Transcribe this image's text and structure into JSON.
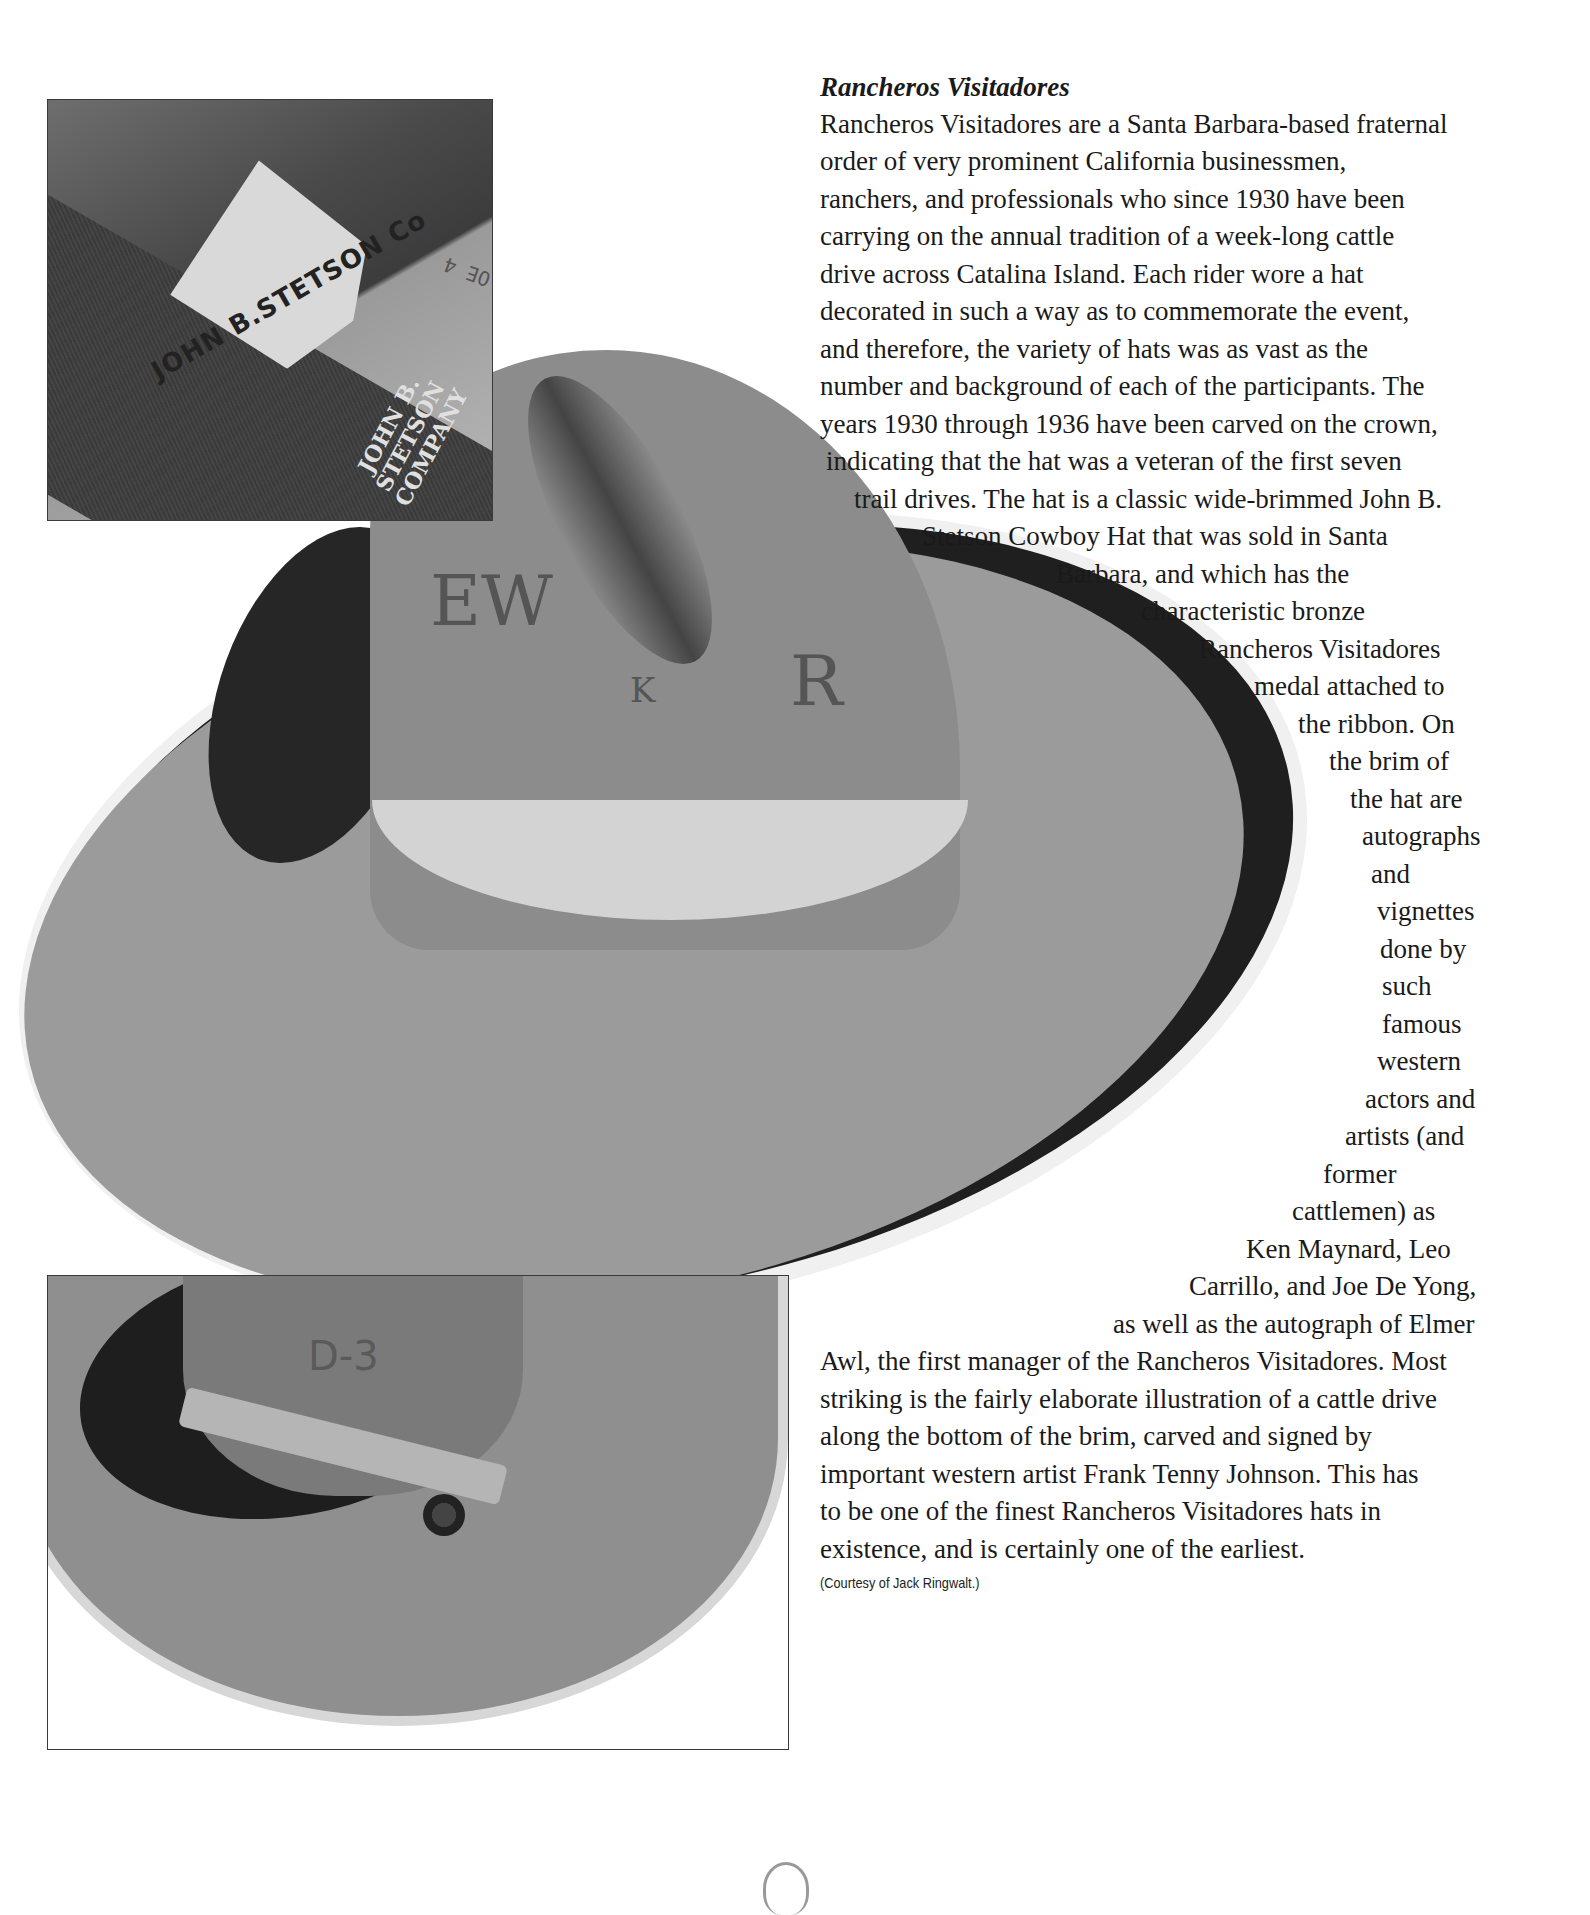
{
  "article": {
    "title": "Rancheros Visitadores",
    "lines": [
      {
        "text": "Rancheros Visitadores are a Santa Barbara-based fraternal",
        "x": 820,
        "y": 109
      },
      {
        "text": "order of very prominent California businessmen,",
        "x": 820,
        "y": 146
      },
      {
        "text": "ranchers, and professionals who since 1930 have been",
        "x": 820,
        "y": 184
      },
      {
        "text": "carrying on the annual tradition of a week-long cattle",
        "x": 820,
        "y": 221
      },
      {
        "text": "drive across Catalina Island. Each rider wore a hat",
        "x": 820,
        "y": 259
      },
      {
        "text": "decorated in such a way as to commemorate the event,",
        "x": 820,
        "y": 296
      },
      {
        "text": "and therefore, the variety of hats was as vast as the",
        "x": 820,
        "y": 334
      },
      {
        "text": "number and background of each of the participants. The",
        "x": 820,
        "y": 371
      },
      {
        "text": "years 1930 through 1936 have been carved on the crown,",
        "x": 820,
        "y": 409
      },
      {
        "text": "indicating that the hat was a veteran of the first seven",
        "x": 826,
        "y": 446
      },
      {
        "text": "trail drives. The hat is a classic wide-brimmed John B.",
        "x": 854,
        "y": 484
      },
      {
        "text": "Stetson Cowboy Hat that was sold in Santa",
        "x": 922,
        "y": 521
      },
      {
        "text": "Barbara, and which has the",
        "x": 1056,
        "y": 559
      },
      {
        "text": "characteristic bronze",
        "x": 1141,
        "y": 596
      },
      {
        "text": "Rancheros Visitadores",
        "x": 1199,
        "y": 634
      },
      {
        "text": "medal attached to",
        "x": 1254,
        "y": 671
      },
      {
        "text": "the ribbon. On",
        "x": 1298,
        "y": 709
      },
      {
        "text": "the brim of",
        "x": 1329,
        "y": 746
      },
      {
        "text": "the hat are",
        "x": 1350,
        "y": 784
      },
      {
        "text": "autographs",
        "x": 1362,
        "y": 821
      },
      {
        "text": "and",
        "x": 1371,
        "y": 859
      },
      {
        "text": "vignettes",
        "x": 1377,
        "y": 896
      },
      {
        "text": "done by",
        "x": 1380,
        "y": 934
      },
      {
        "text": "such",
        "x": 1382,
        "y": 971
      },
      {
        "text": "famous",
        "x": 1382,
        "y": 1009
      },
      {
        "text": "western",
        "x": 1377,
        "y": 1046
      },
      {
        "text": "actors and",
        "x": 1365,
        "y": 1084
      },
      {
        "text": "artists (and",
        "x": 1345,
        "y": 1121
      },
      {
        "text": "former",
        "x": 1323,
        "y": 1159
      },
      {
        "text": "cattlemen) as",
        "x": 1292,
        "y": 1196
      },
      {
        "text": "Ken Maynard, Leo",
        "x": 1246,
        "y": 1234
      },
      {
        "text": "Carrillo, and Joe De Yong,",
        "x": 1189,
        "y": 1271
      },
      {
        "text": "as well as the autograph of Elmer",
        "x": 1113,
        "y": 1309
      },
      {
        "text": "Awl, the first manager of the Rancheros Visitadores. Most",
        "x": 820,
        "y": 1346
      },
      {
        "text": "striking is the fairly elaborate illustration of a cattle drive",
        "x": 820,
        "y": 1384
      },
      {
        "text": "along the bottom of the brim, carved and signed by",
        "x": 820,
        "y": 1421
      },
      {
        "text": "important western artist Frank Tenny Johnson. This has",
        "x": 820,
        "y": 1459
      },
      {
        "text": "to be one of the finest Rancheros Visitadores hats in",
        "x": 820,
        "y": 1496
      },
      {
        "text": "existence, and is certainly one of the earliest.",
        "x": 820,
        "y": 1534
      }
    ],
    "credit": "(Courtesy of Jack Ringwalt.)"
  },
  "images": {
    "inset_top": {
      "description": "Leather sweatband with John B. Stetson Co. trademark stamp",
      "stamp_text": "JOHN B.STETSON Co",
      "company_text": "JOHN B. STETSON COMPANY",
      "size_text": "OE 4"
    },
    "main_hat": {
      "description": "Wide-brimmed John B. Stetson cowboy hat with carved crown",
      "carvings": [
        "EW",
        "K",
        "R"
      ]
    },
    "inset_bottom": {
      "description": "Underside view of hat showing band and bronze medal",
      "carvings": [
        "D-3",
        "Y",
        "L",
        "I"
      ]
    }
  },
  "page_mark": "page-number-glyph"
}
